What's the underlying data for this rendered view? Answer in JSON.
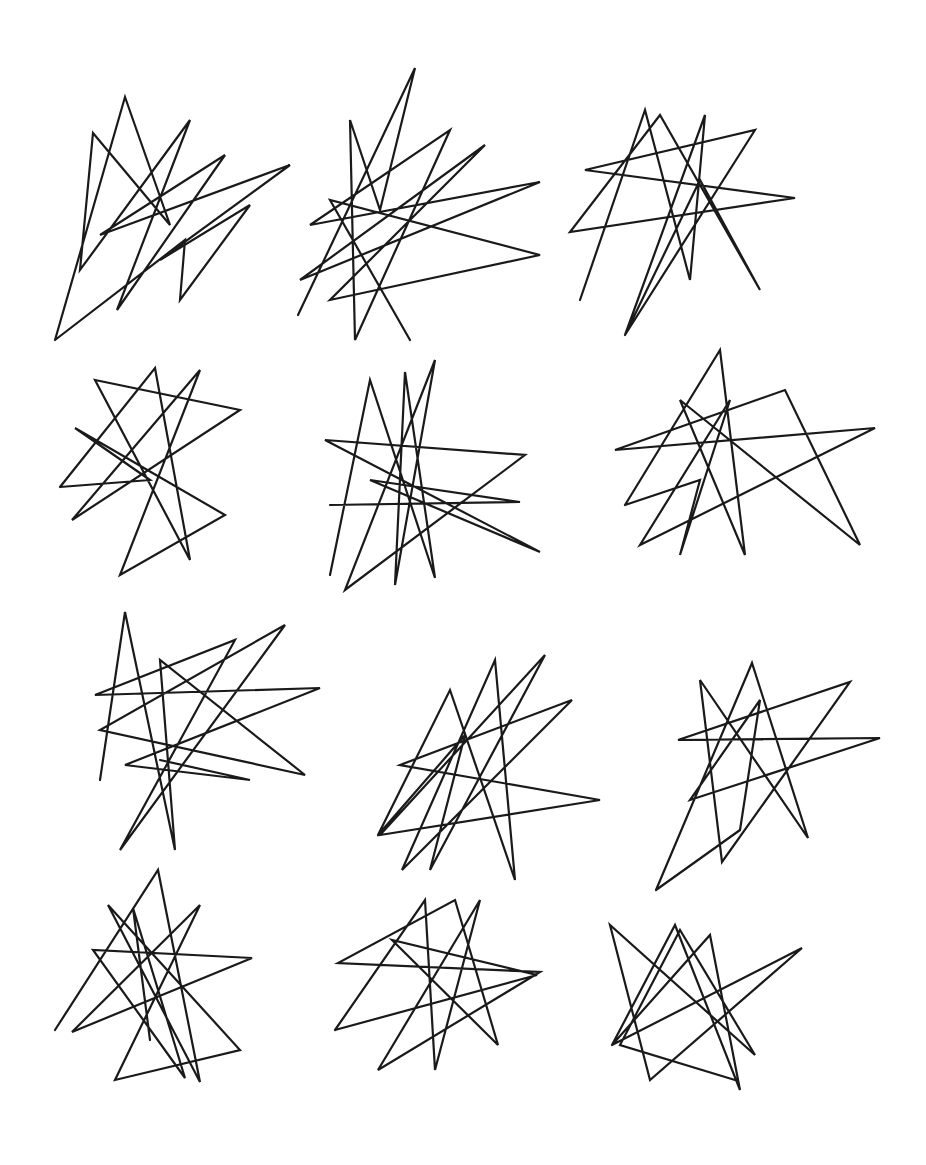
{
  "canvas": {
    "width": 926,
    "height": 1165,
    "background": "#ffffff",
    "stroke": "#1a1a1a"
  },
  "shapes": [
    {
      "name": "star-1",
      "points": "55,340 125,97 170,225 93,133 80,270 190,120 117,310 225,155 100,235 290,165 160,260 250,205 180,300 185,240 55,340"
    },
    {
      "name": "star-2",
      "points": "298,315 415,68 380,210 350,120 355,340 450,130 310,225 540,182 300,280 485,145 330,300 540,255 330,200 410,340"
    },
    {
      "name": "star-3",
      "points": "580,300 645,110 690,280 705,115 625,335 755,130 585,170 795,198 570,232 660,115 760,290 700,180 625,335"
    },
    {
      "name": "star-4",
      "points": "60,487 155,368 190,560 95,380 240,410 72,520 200,370 120,575 225,515 75,428 150,480 60,487"
    },
    {
      "name": "star-5",
      "points": "330,575 370,380 435,578 405,372 395,585 435,360 345,590 525,455 325,440 540,552 370,480 520,502 330,505"
    },
    {
      "name": "star-6",
      "points": "625,505 720,350 745,555 680,400 860,545 785,390 615,450 875,428 640,545 730,400 680,555 700,480 625,505"
    },
    {
      "name": "star-7",
      "points": "100,780 125,612 175,850 160,660 305,775 100,730 285,625 120,850 235,640 95,695 320,688 125,765 250,780 160,760"
    },
    {
      "name": "star-8",
      "points": "378,835 450,690 515,880 495,660 402,870 572,700 400,765 600,800 380,835 545,655 430,870 465,735 378,835"
    },
    {
      "name": "star-9",
      "points": "656,890 752,663 808,838 700,680 722,862 850,682 678,740 880,738 690,800 760,700 740,830 656,890"
    },
    {
      "name": "star-10",
      "points": "55,1030 158,870 200,1082 108,905 240,1050 115,1080 200,905 72,1032 252,958 93,950 185,1078 133,908 150,1040"
    },
    {
      "name": "star-11",
      "points": "335,1030 425,900 435,1070 480,900 378,1070 540,972 338,963 455,900 498,1045 392,940 537,975 335,1030"
    },
    {
      "name": "star-12",
      "points": "612,1045 675,925 740,1090 710,935 612,1045 802,948 650,1080 610,925 755,1055 680,930 620,1045 735,1080"
    }
  ]
}
